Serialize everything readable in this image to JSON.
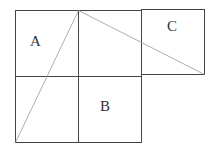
{
  "diagram": {
    "labels": {
      "a": "A",
      "b": "B",
      "c": "C"
    },
    "colors": {
      "grid_line": "#444444",
      "diagonal_line": "#999999",
      "label": "#333333"
    }
  }
}
